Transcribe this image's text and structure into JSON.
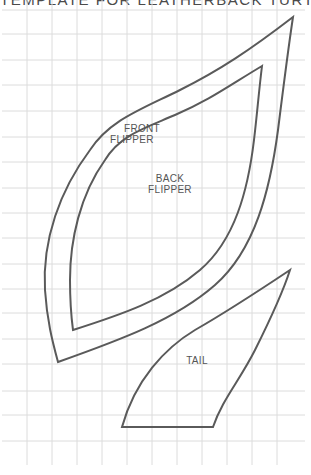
{
  "title": "TEMPLATE FOR LEATHERBACK TURTLE",
  "grid": {
    "spacing_px": 25,
    "x_lines": [
      2,
      27,
      52,
      77,
      102,
      127,
      152,
      177,
      202,
      227,
      252,
      277,
      302
    ],
    "y_lines": [
      10,
      34,
      60,
      85,
      111,
      137,
      162,
      188,
      213,
      238,
      264,
      289,
      313,
      339,
      364,
      391,
      415,
      441
    ],
    "color": "#dcdcdc"
  },
  "pieces": [
    {
      "id": "front-flipper",
      "label_line1": "FRONT",
      "label_line2": "FLIPPER"
    },
    {
      "id": "back-flipper",
      "label_line1": "BACK",
      "label_line2": "FLIPPER"
    },
    {
      "id": "tail",
      "label_line1": "TAIL"
    }
  ],
  "colors": {
    "outline": "#5a5a5a",
    "text": "#555555",
    "background": "#ffffff"
  }
}
